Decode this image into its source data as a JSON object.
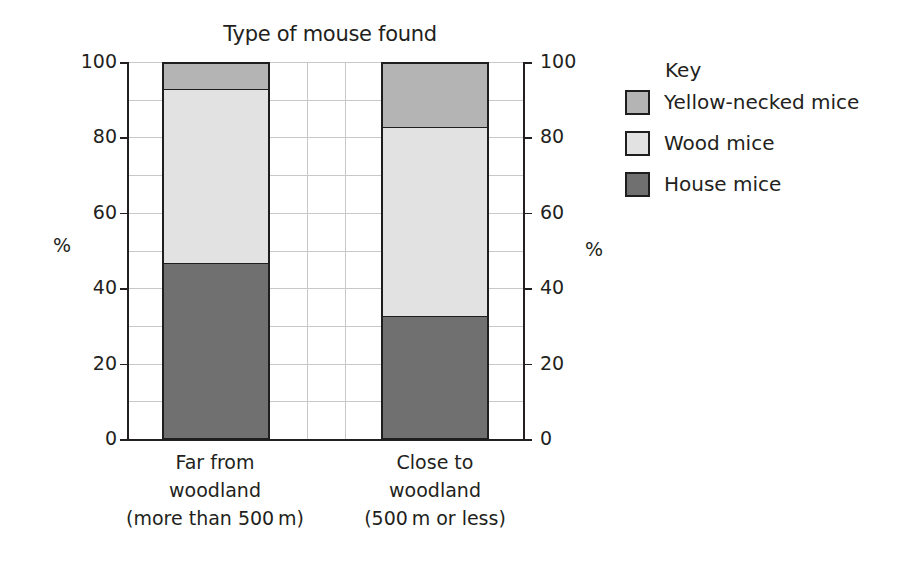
{
  "chart_data": {
    "type": "bar",
    "stacked": true,
    "title": "Type of mouse found",
    "xlabel": "",
    "ylabel": "%",
    "ylabel_right": "%",
    "ylim": [
      0,
      100
    ],
    "yticks": [
      0,
      20,
      40,
      60,
      80,
      100
    ],
    "grid": true,
    "legend_title": "Key",
    "legend_position": "right",
    "categories": [
      "Far from woodland (more than 500 m)",
      "Close to woodland (500 m or less)"
    ],
    "series": [
      {
        "name": "House mice",
        "color": "#707070",
        "values": [
          47,
          33
        ]
      },
      {
        "name": "Wood mice",
        "color": "#e2e2e2",
        "values": [
          46,
          50
        ]
      },
      {
        "name": "Yellow-necked mice",
        "color": "#b4b4b4",
        "values": [
          7,
          17
        ]
      }
    ]
  },
  "labels": {
    "title": "Type of mouse found",
    "y_unit_left": "%",
    "y_unit_right": "%",
    "yticks": [
      "0",
      "20",
      "40",
      "60",
      "80",
      "100"
    ],
    "categories": [
      {
        "line1": "Far from",
        "line2": "woodland",
        "line3": "(more than 500 m)"
      },
      {
        "line1": "Close to",
        "line2": "woodland",
        "line3": "(500 m or less)"
      }
    ],
    "key": {
      "title": "Key",
      "items": [
        {
          "label": "Yellow-necked mice",
          "color": "#b4b4b4"
        },
        {
          "label": "Wood mice",
          "color": "#e2e2e2"
        },
        {
          "label": "House mice",
          "color": "#707070"
        }
      ]
    }
  }
}
